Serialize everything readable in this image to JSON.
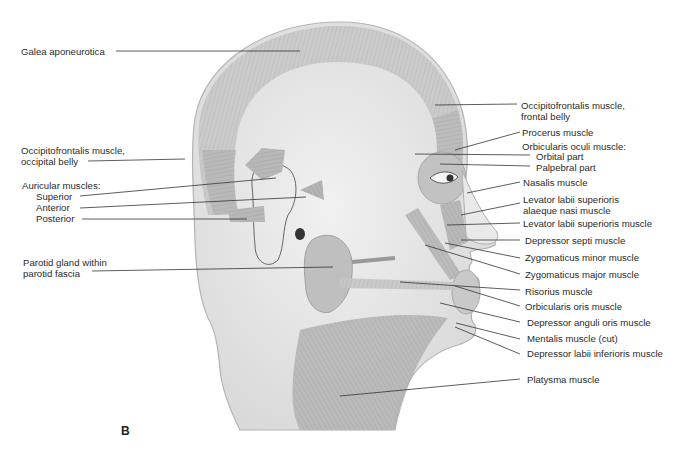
{
  "figure": {
    "panel_label": "B",
    "colors": {
      "background": "#ffffff",
      "skin": "#e4e4e4",
      "skin_texture": "#eeeeee",
      "muscle": "#b9b9b9",
      "muscle_dark": "#a2a2a2",
      "leader_line": "#333333",
      "label_text": "#2b2b2b"
    }
  },
  "labels_left": [
    {
      "id": "galea",
      "text": "Galea aponeurotica"
    },
    {
      "id": "occipital-belly",
      "text": "Occipitofrontalis muscle,\noccipital belly",
      "line1": "Occipitofrontalis muscle,",
      "line2": "occipital belly"
    },
    {
      "id": "auricular-heading",
      "text": "Auricular muscles:"
    },
    {
      "id": "auricular-superior",
      "text": "Superior"
    },
    {
      "id": "auricular-anterior",
      "text": "Anterior"
    },
    {
      "id": "auricular-posterior",
      "text": "Posterior"
    },
    {
      "id": "parotid",
      "line1": "Parotid gland within",
      "line2": "parotid fascia"
    }
  ],
  "labels_right": [
    {
      "id": "frontal-belly",
      "line1": "Occipitofrontalis muscle,",
      "line2": "frontal belly"
    },
    {
      "id": "procerus",
      "text": "Procerus muscle"
    },
    {
      "id": "orbicularis-oculi-heading",
      "text": "Orbicularis oculi muscle:"
    },
    {
      "id": "orbital-part",
      "text": "Orbital part"
    },
    {
      "id": "palpebral-part",
      "text": "Palpebral part"
    },
    {
      "id": "nasalis",
      "text": "Nasalis muscle"
    },
    {
      "id": "lev-alaeque",
      "line1": "Levator labii superioris",
      "line2": "alaeque nasi muscle"
    },
    {
      "id": "lev-labii",
      "text": "Levator labii superioris muscle"
    },
    {
      "id": "depressor-septi",
      "text": "Depressor septi muscle"
    },
    {
      "id": "zyg-minor",
      "text": "Zygomaticus minor muscle"
    },
    {
      "id": "zyg-major",
      "text": "Zygomaticus major muscle"
    },
    {
      "id": "risorius",
      "text": "Risorius muscle"
    },
    {
      "id": "orbicularis-oris",
      "text": "Orbicularis oris muscle"
    },
    {
      "id": "dep-anguli",
      "text": "Depressor anguli oris muscle"
    },
    {
      "id": "mentalis",
      "text": "Mentalis muscle (cut)"
    },
    {
      "id": "dep-labii-inf",
      "text": "Depressor labii inferioris muscle"
    },
    {
      "id": "platysma",
      "text": "Platysma muscle"
    }
  ]
}
